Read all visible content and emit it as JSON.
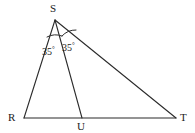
{
  "figure": {
    "kind": "geometry-diagram",
    "background_color": "#ffffff",
    "stroke_color": "#2b2b2b",
    "stroke_width": 1.1
  },
  "points": {
    "S": {
      "label": "S",
      "x": 55,
      "y": 20,
      "label_x": 50,
      "label_y": 3
    },
    "R": {
      "label": "R",
      "x": 24,
      "y": 118,
      "label_x": 8,
      "label_y": 112
    },
    "U": {
      "label": "U",
      "x": 82,
      "y": 118,
      "label_x": 77,
      "label_y": 121
    },
    "T": {
      "label": "T",
      "x": 176,
      "y": 118,
      "label_x": 180,
      "label_y": 112
    }
  },
  "segments": [
    {
      "name": "RS",
      "from": "R",
      "to": "S",
      "d": "M 24 118 L 55 20"
    },
    {
      "name": "ST",
      "from": "S",
      "to": "T",
      "d": "M 55 20 L 176 118"
    },
    {
      "name": "RT",
      "from": "R",
      "to": "T",
      "d": "M 24 118 L 176 118"
    },
    {
      "name": "SU",
      "from": "S",
      "to": "U",
      "d": "M 55 20 L 82 118"
    }
  ],
  "angle_marks": [
    {
      "name": "angle-RSU",
      "vertex": "S",
      "value": "35",
      "degree_symbol": "°",
      "label_x": 42,
      "label_y": 45,
      "arc_d": "M 47 37 A 18 18 0 0 1 62 36"
    },
    {
      "name": "angle-UST",
      "vertex": "S",
      "value": "35",
      "degree_symbol": "°",
      "label_x": 62,
      "label_y": 41,
      "arc_d": "M 62 36 A 18 18 0 0 1 76 30"
    }
  ]
}
